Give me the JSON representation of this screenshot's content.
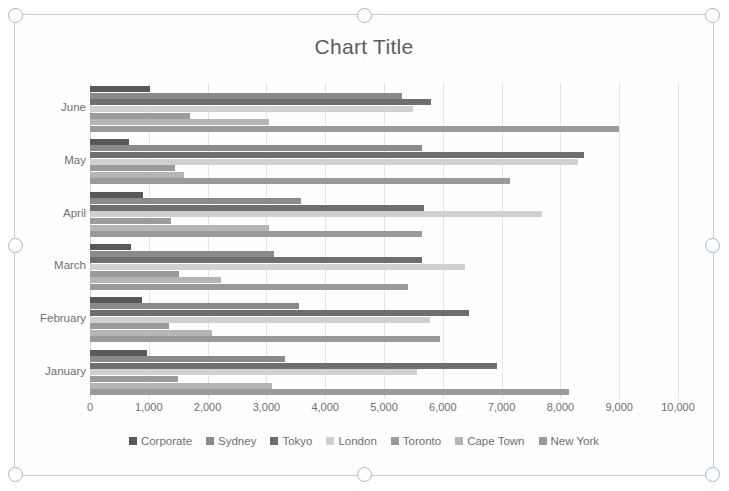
{
  "chart_object": {
    "selected": true,
    "handle_name": "resize-handle"
  },
  "chart_data": {
    "type": "bar",
    "orientation": "horizontal",
    "title": "Chart Title",
    "xlabel": "",
    "ylabel": "",
    "xlim": [
      0,
      10000
    ],
    "xticks": [
      "0",
      "1,000",
      "2,000",
      "3,000",
      "4,000",
      "5,000",
      "6,000",
      "7,000",
      "8,000",
      "9,000",
      "10,000"
    ],
    "xtick_values": [
      0,
      1000,
      2000,
      3000,
      4000,
      5000,
      6000,
      7000,
      8000,
      9000,
      10000
    ],
    "categories": [
      "June",
      "May",
      "April",
      "March",
      "February",
      "January"
    ],
    "grid": true,
    "legend_position": "bottom",
    "series": [
      {
        "name": "Corporate",
        "color": "#595959",
        "values": [
          1020,
          660,
          900,
          700,
          880,
          970
        ]
      },
      {
        "name": "Sydney",
        "color": "#8a8a8a",
        "values": [
          5300,
          5650,
          3580,
          3130,
          3550,
          3320
        ]
      },
      {
        "name": "Tokyo",
        "color": "#6e6e6e",
        "values": [
          5800,
          8400,
          5680,
          5650,
          6450,
          6930
        ]
      },
      {
        "name": "London",
        "color": "#d0d0d0",
        "values": [
          5500,
          8300,
          7680,
          6380,
          5780,
          5560
        ]
      },
      {
        "name": "Toronto",
        "color": "#9b9b9b",
        "values": [
          1700,
          1450,
          1380,
          1520,
          1340,
          1500
        ]
      },
      {
        "name": "Cape Town",
        "color": "#b5b5b5",
        "values": [
          3050,
          1600,
          3040,
          2230,
          2080,
          3090
        ]
      },
      {
        "name": "New York",
        "color": "#9a9a9a",
        "values": [
          9000,
          7150,
          5650,
          5400,
          5950,
          8150
        ]
      }
    ]
  }
}
